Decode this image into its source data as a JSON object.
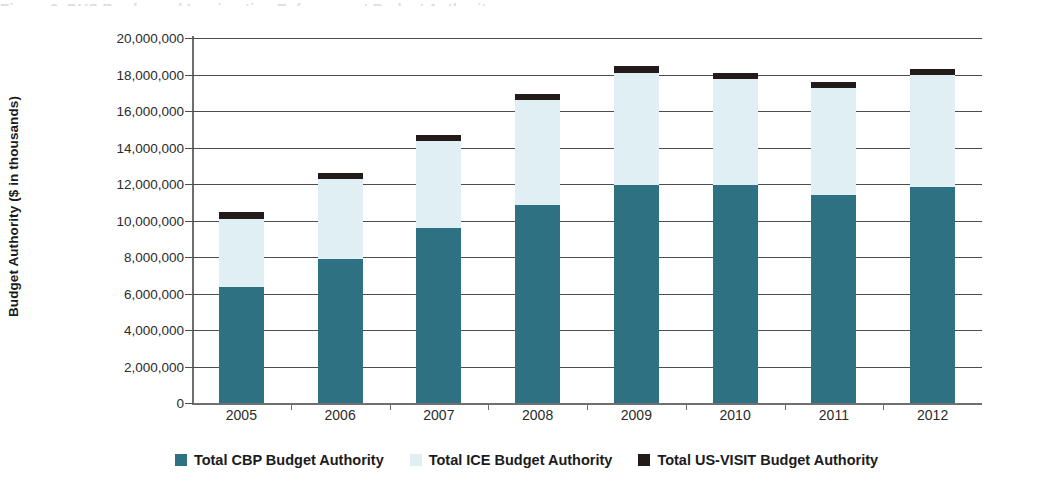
{
  "figure": {
    "cutoff_title": "Figure 2. DHS Border and Immigration Enforcement Budget Authority",
    "ylabel": "Budget Authority ($ in thousands)"
  },
  "legend": {
    "position": "bottom-center",
    "items": [
      {
        "label": "Total CBP Budget Authority",
        "color": "#2e7183",
        "swatch_name": "cbp-swatch"
      },
      {
        "label": "Total ICE Budget Authority",
        "color": "#e0eff4",
        "swatch_name": "ice-swatch"
      },
      {
        "label": "Total US-VISIT Budget Authority",
        "color": "#231a1a",
        "swatch_name": "us-visit-swatch"
      }
    ]
  },
  "chart_data": {
    "type": "bar",
    "subtype": "stacked-column",
    "title": "",
    "xlabel": "",
    "ylabel": "Budget Authority ($ in thousands)",
    "categories": [
      "2005",
      "2006",
      "2007",
      "2008",
      "2009",
      "2010",
      "2011",
      "2012"
    ],
    "ylim": [
      0,
      20000000
    ],
    "ytick_values": [
      0,
      2000000,
      4000000,
      6000000,
      8000000,
      10000000,
      12000000,
      14000000,
      16000000,
      18000000,
      20000000
    ],
    "ytick_labels": [
      "0",
      "2,000,000",
      "4,000,000",
      "6,000,000",
      "8,000,000",
      "10,000,000",
      "12,000,000",
      "14,000,000",
      "16,000,000",
      "18,000,000",
      "20,000,000"
    ],
    "grid": true,
    "grid_axis": "y",
    "series": [
      {
        "name": "Total CBP Budget Authority",
        "color": "#2e7183",
        "values": [
          6350000,
          7900000,
          9600000,
          10850000,
          11950000,
          11950000,
          11400000,
          11850000
        ]
      },
      {
        "name": "Total ICE Budget Authority",
        "color": "#e0eff4",
        "values": [
          3750000,
          4350000,
          4750000,
          5750000,
          6150000,
          5800000,
          5850000,
          6100000
        ]
      },
      {
        "name": "Total US-VISIT Budget Authority",
        "color": "#231a1a",
        "values": [
          340000,
          340000,
          340000,
          340000,
          340000,
          340000,
          340000,
          340000
        ]
      }
    ],
    "totals": [
      10440000,
      12590000,
      14690000,
      16940000,
      18440000,
      18090000,
      17590000,
      18290000
    ]
  }
}
